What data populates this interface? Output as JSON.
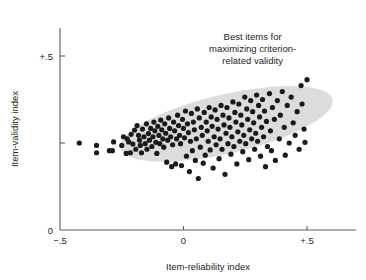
{
  "chart_data": {
    "type": "scatter",
    "title": "",
    "xlabel": "Item-reliability index",
    "ylabel": "Item-validity index",
    "xlim": [
      -0.5,
      0.58
    ],
    "ylim": [
      0,
      0.565
    ],
    "grid": false,
    "legend": null,
    "xticks": [
      {
        "value": -0.5,
        "label": "−.5"
      },
      {
        "value": 0.0,
        "label": "0"
      },
      {
        "value": 0.5,
        "label": "+.5"
      }
    ],
    "yticks": [
      {
        "value": 0.0,
        "label": "0"
      },
      {
        "value": 0.25,
        "label": ""
      },
      {
        "value": 0.5,
        "label": "+.5"
      }
    ],
    "annotations": [
      {
        "name": "best-items-callout",
        "lines": [
          "Best items for",
          "maximizing criterion-",
          "related validity"
        ],
        "x": 0.28,
        "y": 0.545,
        "align": "center"
      }
    ],
    "highlight_region": {
      "name": "best-items-ellipse",
      "shape": "ellipse",
      "color": "#dcdcdc",
      "center_x": 0.175,
      "center_y": 0.305,
      "semi_major": 0.44,
      "semi_minor": 0.085,
      "rotation_deg": -13
    },
    "series": [
      {
        "name": "items",
        "marker": "circle",
        "color": "#1a1a1a",
        "size": 2.6,
        "points": [
          [
            -0.422,
            0.25
          ],
          [
            -0.352,
            0.243
          ],
          [
            -0.352,
            0.222
          ],
          [
            -0.3,
            0.228
          ],
          [
            -0.288,
            0.228
          ],
          [
            -0.283,
            0.253
          ],
          [
            -0.25,
            0.243
          ],
          [
            -0.243,
            0.268
          ],
          [
            -0.232,
            0.22
          ],
          [
            -0.228,
            0.262
          ],
          [
            -0.222,
            0.253
          ],
          [
            -0.215,
            0.222
          ],
          [
            -0.212,
            0.275
          ],
          [
            -0.205,
            0.247
          ],
          [
            -0.198,
            0.287
          ],
          [
            -0.193,
            0.232
          ],
          [
            -0.188,
            0.3
          ],
          [
            -0.182,
            0.272
          ],
          [
            -0.178,
            0.258
          ],
          [
            -0.175,
            0.243
          ],
          [
            -0.17,
            0.222
          ],
          [
            -0.166,
            0.29
          ],
          [
            -0.16,
            0.268
          ],
          [
            -0.155,
            0.248
          ],
          [
            -0.15,
            0.305
          ],
          [
            -0.148,
            0.232
          ],
          [
            -0.142,
            0.277
          ],
          [
            -0.138,
            0.258
          ],
          [
            -0.133,
            0.292
          ],
          [
            -0.128,
            0.24
          ],
          [
            -0.124,
            0.268
          ],
          [
            -0.12,
            0.31
          ],
          [
            -0.116,
            0.285
          ],
          [
            -0.112,
            0.252
          ],
          [
            -0.108,
            0.22
          ],
          [
            -0.104,
            0.298
          ],
          [
            -0.1,
            0.272
          ],
          [
            -0.096,
            0.248
          ],
          [
            -0.092,
            0.316
          ],
          [
            -0.088,
            0.288
          ],
          [
            -0.084,
            0.262
          ],
          [
            -0.08,
            0.238
          ],
          [
            -0.076,
            0.305
          ],
          [
            -0.072,
            0.278
          ],
          [
            -0.068,
            0.195
          ],
          [
            -0.064,
            0.258
          ],
          [
            -0.06,
            0.322
          ],
          [
            -0.056,
            0.292
          ],
          [
            -0.052,
            0.268
          ],
          [
            -0.048,
            0.182
          ],
          [
            -0.044,
            0.245
          ],
          [
            -0.04,
            0.31
          ],
          [
            -0.036,
            0.285
          ],
          [
            -0.032,
            0.19
          ],
          [
            -0.028,
            0.262
          ],
          [
            -0.024,
            0.33
          ],
          [
            -0.02,
            0.3
          ],
          [
            -0.016,
            0.272
          ],
          [
            -0.012,
            0.248
          ],
          [
            -0.008,
            0.185
          ],
          [
            -0.004,
            0.318
          ],
          [
            0.0,
            0.292
          ],
          [
            0.004,
            0.265
          ],
          [
            0.008,
            0.342
          ],
          [
            0.012,
            0.212
          ],
          [
            0.016,
            0.305
          ],
          [
            0.02,
            0.28
          ],
          [
            0.024,
            0.168
          ],
          [
            0.028,
            0.255
          ],
          [
            0.032,
            0.335
          ],
          [
            0.036,
            0.228
          ],
          [
            0.04,
            0.31
          ],
          [
            0.044,
            0.288
          ],
          [
            0.048,
            0.2
          ],
          [
            0.052,
            0.262
          ],
          [
            0.056,
            0.348
          ],
          [
            0.06,
            0.148
          ],
          [
            0.064,
            0.322
          ],
          [
            0.068,
            0.238
          ],
          [
            0.072,
            0.295
          ],
          [
            0.076,
            0.272
          ],
          [
            0.08,
            0.192
          ],
          [
            0.084,
            0.338
          ],
          [
            0.088,
            0.215
          ],
          [
            0.092,
            0.31
          ],
          [
            0.096,
            0.285
          ],
          [
            0.1,
            0.255
          ],
          [
            0.104,
            0.352
          ],
          [
            0.108,
            0.23
          ],
          [
            0.112,
            0.325
          ],
          [
            0.116,
            0.298
          ],
          [
            0.12,
            0.178
          ],
          [
            0.124,
            0.268
          ],
          [
            0.128,
            0.345
          ],
          [
            0.132,
            0.245
          ],
          [
            0.136,
            0.318
          ],
          [
            0.14,
            0.29
          ],
          [
            0.144,
            0.205
          ],
          [
            0.148,
            0.262
          ],
          [
            0.152,
            0.358
          ],
          [
            0.156,
            0.232
          ],
          [
            0.16,
            0.33
          ],
          [
            0.164,
            0.302
          ],
          [
            0.168,
            0.16
          ],
          [
            0.172,
            0.278
          ],
          [
            0.176,
            0.352
          ],
          [
            0.18,
            0.248
          ],
          [
            0.184,
            0.322
          ],
          [
            0.188,
            0.295
          ],
          [
            0.192,
            0.218
          ],
          [
            0.196,
            0.268
          ],
          [
            0.2,
            0.368
          ],
          [
            0.204,
            0.24
          ],
          [
            0.208,
            0.338
          ],
          [
            0.212,
            0.31
          ],
          [
            0.216,
            0.19
          ],
          [
            0.22,
            0.282
          ],
          [
            0.224,
            0.362
          ],
          [
            0.228,
            0.255
          ],
          [
            0.232,
            0.33
          ],
          [
            0.236,
            0.302
          ],
          [
            0.24,
            0.225
          ],
          [
            0.244,
            0.272
          ],
          [
            0.248,
            0.382
          ],
          [
            0.252,
            0.248
          ],
          [
            0.256,
            0.348
          ],
          [
            0.26,
            0.318
          ],
          [
            0.264,
            0.202
          ],
          [
            0.268,
            0.288
          ],
          [
            0.272,
            0.372
          ],
          [
            0.276,
            0.262
          ],
          [
            0.28,
            0.34
          ],
          [
            0.284,
            0.308
          ],
          [
            0.288,
            0.232
          ],
          [
            0.292,
            0.278
          ],
          [
            0.296,
            0.388
          ],
          [
            0.3,
            0.255
          ],
          [
            0.304,
            0.358
          ],
          [
            0.308,
            0.325
          ],
          [
            0.312,
            0.212
          ],
          [
            0.316,
            0.295
          ],
          [
            0.32,
            0.375
          ],
          [
            0.324,
            0.268
          ],
          [
            0.328,
            0.342
          ],
          [
            0.332,
            0.182
          ],
          [
            0.336,
            0.312
          ],
          [
            0.34,
            0.24
          ],
          [
            0.348,
            0.392
          ],
          [
            0.352,
            0.285
          ],
          [
            0.356,
            0.228
          ],
          [
            0.36,
            0.352
          ],
          [
            0.368,
            0.318
          ],
          [
            0.372,
            0.2
          ],
          [
            0.38,
            0.372
          ],
          [
            0.388,
            0.262
          ],
          [
            0.392,
            0.33
          ],
          [
            0.4,
            0.398
          ],
          [
            0.408,
            0.295
          ],
          [
            0.412,
            0.215
          ],
          [
            0.42,
            0.358
          ],
          [
            0.428,
            0.25
          ],
          [
            0.436,
            0.382
          ],
          [
            0.444,
            0.308
          ],
          [
            0.452,
            0.272
          ],
          [
            0.46,
            0.34
          ],
          [
            0.468,
            0.232
          ],
          [
            0.476,
            0.415
          ],
          [
            0.48,
            0.362
          ],
          [
            0.488,
            0.29
          ],
          [
            0.492,
            0.252
          ],
          [
            0.5,
            0.432
          ]
        ]
      }
    ]
  }
}
